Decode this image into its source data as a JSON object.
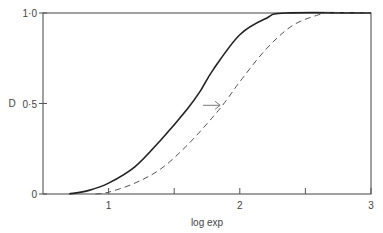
{
  "chart_data": {
    "type": "line",
    "title": "",
    "xlabel": "log exp",
    "ylabel": "D",
    "xlim": [
      0.5,
      3
    ],
    "ylim": [
      0,
      1.0
    ],
    "grid": false,
    "x_ticks": [
      1,
      1.5,
      2,
      2.5,
      3
    ],
    "x_tick_labels": [
      "1",
      "",
      "2",
      "",
      "3"
    ],
    "y_ticks": [
      0,
      0.5,
      1.0
    ],
    "y_tick_labels": [
      "0",
      "0·5",
      "1·0"
    ],
    "series": [
      {
        "name": "solid",
        "style": "solid",
        "color": "#222222",
        "x": [
          0.7,
          0.85,
          1.0,
          1.2,
          1.4,
          1.6,
          1.7,
          1.8,
          2.0,
          2.2,
          2.35,
          3.0
        ],
        "y": [
          0,
          0.02,
          0.06,
          0.15,
          0.3,
          0.47,
          0.57,
          0.69,
          0.88,
          0.97,
          1.0,
          1.0
        ]
      },
      {
        "name": "dashed",
        "style": "dashed",
        "color": "#555555",
        "x": [
          0.9,
          1.0,
          1.2,
          1.4,
          1.6,
          1.8,
          1.9,
          2.0,
          2.2,
          2.4,
          2.6,
          2.7,
          3.0
        ],
        "y": [
          0,
          0.01,
          0.06,
          0.14,
          0.27,
          0.43,
          0.52,
          0.62,
          0.8,
          0.93,
          0.99,
          1.0,
          1.0
        ]
      }
    ],
    "annotations": [
      {
        "type": "arrow",
        "direction": "right",
        "x_from": 1.72,
        "x_to": 1.85,
        "y": 0.49,
        "text": "→"
      }
    ]
  }
}
